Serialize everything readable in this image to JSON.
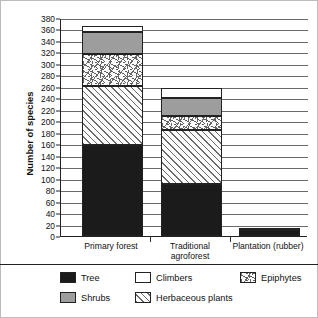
{
  "chart_data": {
    "type": "bar",
    "subtype": "stacked-bar",
    "title": "",
    "xlabel": "",
    "ylabel": "Number of species",
    "ylim": [
      0,
      380
    ],
    "ytick_step": 20,
    "yticks": [
      0,
      20,
      40,
      60,
      80,
      100,
      120,
      140,
      160,
      180,
      200,
      220,
      240,
      260,
      280,
      300,
      320,
      340,
      360,
      380
    ],
    "grid": true,
    "legend_position": "bottom",
    "categories": [
      "Primary forest",
      "Traditional agroforest",
      "Plantation (rubber)"
    ],
    "series": [
      {
        "name": "Tree",
        "values": [
          158,
          90,
          10
        ]
      },
      {
        "name": "Herbaceous plants",
        "values": [
          104,
          95,
          0
        ]
      },
      {
        "name": "Epiphytes",
        "values": [
          56,
          25,
          0
        ]
      },
      {
        "name": "Shrubs",
        "values": [
          37,
          30,
          0
        ]
      },
      {
        "name": "Climbers",
        "values": [
          11,
          18,
          4
        ]
      }
    ],
    "totals": [
      366,
      258,
      14
    ],
    "stack_order_bottom_to_top": [
      "Tree",
      "Herbaceous plants",
      "Epiphytes",
      "Shrubs",
      "Climbers"
    ]
  },
  "axis": {
    "y_title": "Number of species",
    "y_labels": [
      "380",
      "360",
      "340",
      "320",
      "300",
      "280",
      "260",
      "240",
      "220",
      "200",
      "180",
      "160",
      "140",
      "120",
      "100",
      "80",
      "60",
      "40",
      "20",
      "0"
    ]
  },
  "categories": [
    {
      "label": "Primary forest",
      "line2": ""
    },
    {
      "label": "Traditional",
      "line2": "agroforest"
    },
    {
      "label": "Plantation (rubber)",
      "line2": ""
    }
  ],
  "legend": {
    "items": [
      {
        "name": "Tree",
        "pattern": "solid-black",
        "color": "#1b1b1b"
      },
      {
        "name": "Climbers",
        "pattern": "solid-white",
        "color": "#ffffff"
      },
      {
        "name": "Epiphytes",
        "pattern": "scattered-dashes",
        "color": "#fbfbfb"
      },
      {
        "name": "Shrubs",
        "pattern": "solid-grey",
        "color": "#9d9d9d"
      },
      {
        "name": "Herbaceous plants",
        "pattern": "diagonal-hatch",
        "color": "#fcfcfc"
      }
    ]
  }
}
